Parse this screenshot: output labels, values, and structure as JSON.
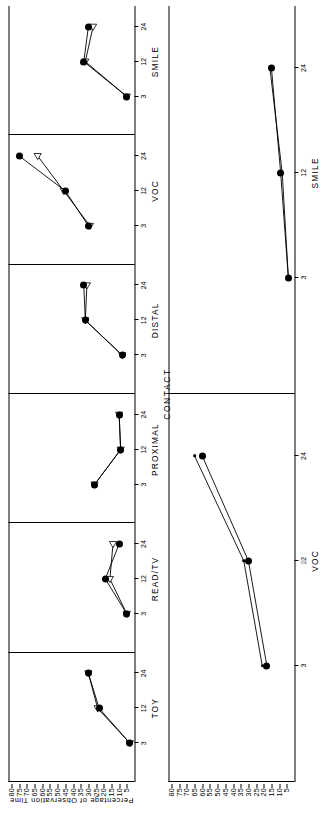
{
  "figure": {
    "y_axis_title": "Percentage of Observation Time",
    "group_title": "CONTACT",
    "y_ticks": [
      80,
      75,
      70,
      65,
      60,
      55,
      50,
      45,
      40,
      35,
      30,
      25,
      20,
      15,
      10,
      5
    ],
    "y_min": 0,
    "y_max": 82,
    "x_ticks": [
      "3",
      "12",
      "24"
    ],
    "marker_filled_name": "filled-circle-marker",
    "marker_open_name": "open-triangle-marker",
    "ink_color": "#000000"
  },
  "chart_data": {
    "type": "line",
    "title": "",
    "subtitle": "",
    "xlabel": "Age in months",
    "ylabel": "Percentage of Observation Time",
    "ylim": [
      0,
      82
    ],
    "yticks": [
      80,
      75,
      70,
      65,
      60,
      55,
      50,
      45,
      40,
      35,
      30,
      25,
      20,
      15,
      10,
      5
    ],
    "x": [
      3,
      12,
      24
    ],
    "xticklabels": [
      "3",
      "12",
      "24"
    ],
    "grid": false,
    "legend": "none",
    "group_label": "CONTACT",
    "panels": [
      {
        "label": "TOY",
        "row": "bottom",
        "order": 1,
        "series": [
          {
            "name": "filled-circle",
            "marker": "filled-circle",
            "values": [
              3,
              23,
              30
            ]
          },
          {
            "name": "open-triangle",
            "marker": "open-triangle",
            "values": [
              3,
              24,
              30
            ]
          }
        ]
      },
      {
        "label": "READ/TV",
        "row": "bottom",
        "order": 2,
        "series": [
          {
            "name": "filled-circle",
            "marker": "filled-circle",
            "values": [
              5,
              19,
              10
            ]
          },
          {
            "name": "open-triangle",
            "marker": "open-triangle",
            "values": [
              5,
              16,
              14
            ]
          }
        ]
      },
      {
        "label": "PROXIMAL",
        "row": "bottom",
        "order": 3,
        "series": [
          {
            "name": "filled-circle",
            "marker": "filled-circle",
            "values": [
              26,
              9,
              10
            ]
          },
          {
            "name": "open-triangle",
            "marker": "open-triangle",
            "values": [
              26,
              9,
              10
            ]
          }
        ]
      },
      {
        "label": "DISTAL",
        "row": "bottom",
        "order": 4,
        "series": [
          {
            "name": "filled-circle",
            "marker": "filled-circle",
            "values": [
              8,
              32,
              33
            ]
          },
          {
            "name": "open-triangle",
            "marker": "open-triangle",
            "values": [
              8,
              32,
              31
            ]
          }
        ]
      },
      {
        "label": "VOC",
        "row": "bottom",
        "order": 5,
        "series": [
          {
            "name": "filled-circle",
            "marker": "filled-circle",
            "values": [
              30,
              45,
              75
            ]
          },
          {
            "name": "open-triangle",
            "marker": "open-triangle",
            "values": [
              29,
              46,
              63
            ]
          }
        ]
      },
      {
        "label": "SMILE",
        "row": "bottom",
        "order": 6,
        "series": [
          {
            "name": "filled-circle",
            "marker": "filled-circle",
            "values": [
              5,
              33,
              30
            ]
          },
          {
            "name": "open-triangle",
            "marker": "open-triangle",
            "values": [
              5,
              32,
              27
            ]
          }
        ]
      },
      {
        "label": "VOC",
        "row": "top",
        "order": 1,
        "series": [
          {
            "name": "filled-circle",
            "marker": "filled-circle",
            "values": [
              18,
              30,
              60
            ]
          },
          {
            "name": "open-triangle",
            "marker": "small-dot",
            "values": [
              21,
              33,
              65
            ]
          }
        ]
      },
      {
        "label": "SMILE",
        "row": "top",
        "order": 2,
        "series": [
          {
            "name": "filled-circle",
            "marker": "filled-circle",
            "values": [
              4,
              9,
              15
            ]
          },
          {
            "name": "open-triangle",
            "marker": "small-dot",
            "values": [
              4,
              8,
              16
            ]
          }
        ]
      }
    ]
  }
}
